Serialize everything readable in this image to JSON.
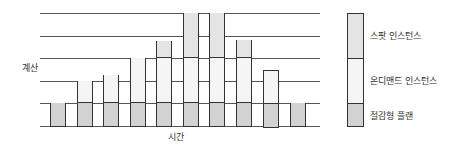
{
  "chart_data": {
    "type": "bar",
    "stacked": true,
    "title": "",
    "xlabel": "시간",
    "ylabel": "계산",
    "categories": [
      "1",
      "2",
      "3",
      "4",
      "5",
      "6",
      "7",
      "8",
      "9",
      "10"
    ],
    "series": [
      {
        "name": "절감형 플랜",
        "color": "#d2d2d2",
        "values": [
          1,
          1,
          1,
          1,
          1,
          1,
          1,
          1,
          1,
          1
        ]
      },
      {
        "name": "온디맨드 인스턴스",
        "color": "#f5f5f5",
        "values": [
          0,
          1,
          1.25,
          2,
          2,
          2,
          2,
          2,
          1.5,
          0
        ]
      },
      {
        "name": "스팟 인스턴스",
        "color": "#e4e4e4",
        "values": [
          0,
          0,
          0,
          0,
          0.75,
          2,
          2,
          0.8,
          0,
          0
        ]
      }
    ],
    "ylim": [
      0,
      5
    ],
    "grid": true,
    "legend_position": "right"
  },
  "axes": {
    "xlabel": "시간",
    "ylabel": "계산"
  },
  "legend": [
    {
      "label": "스팟 인스턴스",
      "color": "#e4e4e4"
    },
    {
      "label": "온디맨드 인스턴스",
      "color": "#f5f5f5"
    },
    {
      "label": "절감형 플랜",
      "color": "#d2d2d2"
    }
  ]
}
